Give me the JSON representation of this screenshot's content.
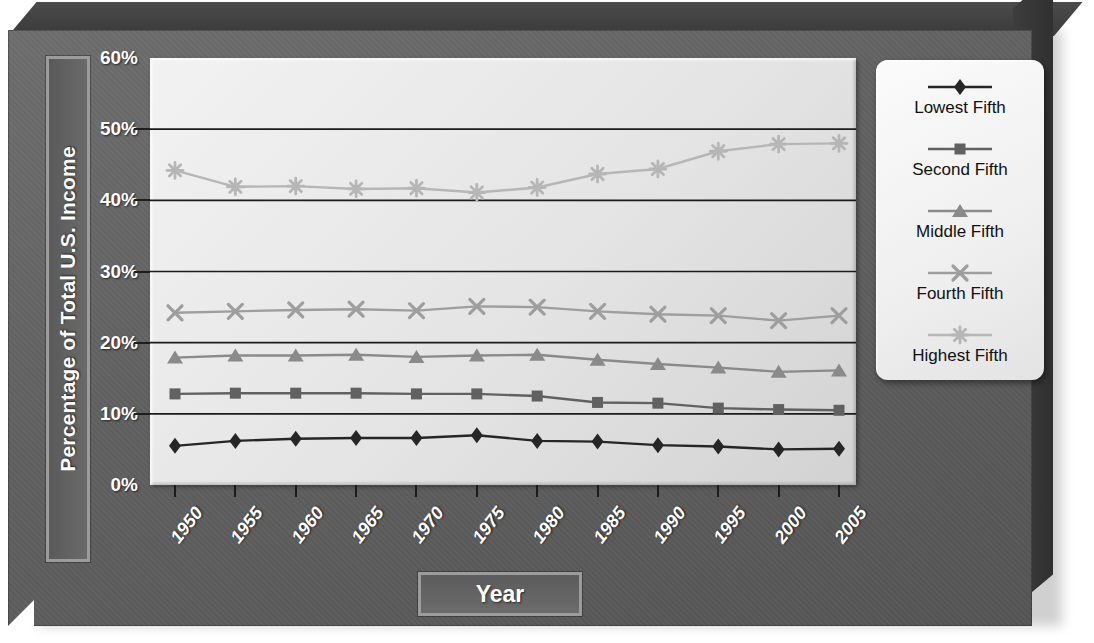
{
  "chart_data": {
    "type": "line",
    "title": "",
    "xlabel": "Year",
    "ylabel": "Percentage of Total U.S. Income",
    "categories": [
      "1950",
      "1955",
      "1960",
      "1965",
      "1970",
      "1975",
      "1980",
      "1985",
      "1990",
      "1995",
      "2000",
      "2005"
    ],
    "ylim": [
      0,
      60
    ],
    "ytick_labels": [
      "0%",
      "10%",
      "20%",
      "30%",
      "40%",
      "50%",
      "60%"
    ],
    "ytick_values": [
      0,
      10,
      20,
      30,
      40,
      50,
      60
    ],
    "grid": true,
    "legend_position": "right",
    "series": [
      {
        "name": "Lowest Fifth",
        "marker": "diamond",
        "color": "#262626",
        "values": [
          5.5,
          6.2,
          6.5,
          6.6,
          6.6,
          7.0,
          6.2,
          6.1,
          5.6,
          5.4,
          5.0,
          5.1
        ]
      },
      {
        "name": "Second Fifth",
        "marker": "square",
        "color": "#616161",
        "values": [
          12.8,
          12.9,
          12.9,
          12.9,
          12.8,
          12.8,
          12.5,
          11.6,
          11.5,
          10.8,
          10.6,
          10.5
        ]
      },
      {
        "name": "Middle Fifth",
        "marker": "triangle",
        "color": "#8a8a8a",
        "values": [
          17.9,
          18.2,
          18.2,
          18.3,
          18.0,
          18.2,
          18.3,
          17.6,
          17.0,
          16.5,
          15.9,
          16.1
        ]
      },
      {
        "name": "Fourth Fifth",
        "marker": "cross",
        "color": "#9e9e9e",
        "values": [
          24.2,
          24.4,
          24.6,
          24.7,
          24.5,
          25.1,
          25.0,
          24.4,
          24.0,
          23.8,
          23.1,
          23.8
        ]
      },
      {
        "name": "Highest Fifth",
        "marker": "star",
        "color": "#b6b6b6",
        "values": [
          44.2,
          41.9,
          42.0,
          41.6,
          41.7,
          41.1,
          41.8,
          43.7,
          44.4,
          46.9,
          47.9,
          48.0
        ]
      }
    ]
  },
  "axes": {
    "y_title": "Percentage of Total U.S. Income",
    "x_title": "Year"
  },
  "legend": {
    "items": [
      {
        "label": "Lowest Fifth",
        "marker": "diamond-marker-icon"
      },
      {
        "label": "Second Fifth",
        "marker": "square-marker-icon"
      },
      {
        "label": "Middle Fifth",
        "marker": "triangle-marker-icon"
      },
      {
        "label": "Fourth Fifth",
        "marker": "cross-marker-icon"
      },
      {
        "label": "Highest Fifth",
        "marker": "star-marker-icon"
      }
    ]
  },
  "colors": {
    "plot_background": "#e8e8e8",
    "slab": "#606060",
    "gridline": "#1b1b1b",
    "axis_text": "#ffffff"
  }
}
